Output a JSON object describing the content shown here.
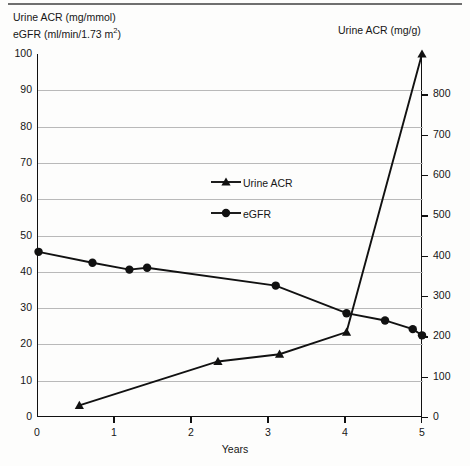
{
  "chart_data": {
    "type": "line",
    "title": "",
    "subtitle": "",
    "xlabel": "Years",
    "ylabel": "Urine ACR (mg/mmol) eGFR (ml/min/1.73 m2)",
    "ylabel_left_line1": "Urine ACR (mg/mmol)",
    "ylabel_left_line2_pre": "eGFR (ml/min/1.73 m",
    "ylabel_left_line2_sup": "2",
    "ylabel_left_line2_post": ")",
    "ylabel_right": "Urine ACR (mg/g)",
    "xlim": [
      0,
      5
    ],
    "ylim": [
      0,
      100
    ],
    "ylim_right": [
      0,
      900
    ],
    "xticks": [
      0,
      1,
      2,
      3,
      4,
      5
    ],
    "xtick_labels": [
      "0",
      "1",
      "2",
      "3",
      "4",
      "5"
    ],
    "yticks_left": [
      0,
      10,
      20,
      30,
      40,
      50,
      60,
      70,
      80,
      90,
      100
    ],
    "ytick_labels_left": [
      "0",
      "10",
      "20",
      "30",
      "40",
      "50",
      "60",
      "70",
      "80",
      "90",
      "100"
    ],
    "yticks_right": [
      0,
      100,
      200,
      300,
      400,
      500,
      600,
      700,
      800
    ],
    "ytick_labels_right": [
      "0",
      "100",
      "200",
      "300",
      "400",
      "500",
      "600",
      "700",
      "800"
    ],
    "grid": "horizontal",
    "legend_position": "inside-center",
    "series": [
      {
        "name": "Urine ACR",
        "marker": "triangle",
        "axis": "left",
        "color": "#111111",
        "points": [
          {
            "x": 0.55,
            "y": 3.2
          },
          {
            "x": 2.35,
            "y": 15.3
          },
          {
            "x": 3.15,
            "y": 17.3
          },
          {
            "x": 4.02,
            "y": 23.4
          },
          {
            "x": 5.0,
            "y": 100.0
          }
        ]
      },
      {
        "name": "eGFR",
        "marker": "circle",
        "axis": "left",
        "color": "#111111",
        "points": [
          {
            "x": 0.02,
            "y": 45.5
          },
          {
            "x": 0.72,
            "y": 42.5
          },
          {
            "x": 1.2,
            "y": 40.6
          },
          {
            "x": 1.43,
            "y": 41.1
          },
          {
            "x": 3.1,
            "y": 36.2
          },
          {
            "x": 4.02,
            "y": 28.6
          },
          {
            "x": 4.52,
            "y": 26.6
          },
          {
            "x": 4.88,
            "y": 24.2
          },
          {
            "x": 5.0,
            "y": 22.5
          }
        ]
      }
    ]
  },
  "legend": {
    "items": [
      {
        "label": "Urine ACR",
        "marker": "triangle"
      },
      {
        "label": "eGFR",
        "marker": "circle"
      }
    ]
  }
}
